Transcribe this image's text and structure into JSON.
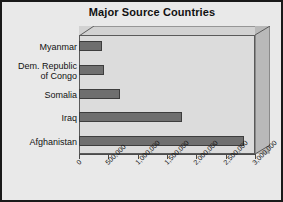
{
  "chart_data": {
    "type": "bar",
    "orientation": "horizontal",
    "title": "Major Source Countries",
    "xlabel": "",
    "ylabel": "",
    "categories": [
      "Myanmar",
      "Dem. Republic of Congo",
      "Somalia",
      "Iraq",
      "Afghanistan"
    ],
    "values": [
      390000,
      420000,
      700000,
      1750000,
      2820000
    ],
    "xlim": [
      0,
      3000000
    ],
    "xticks": [
      0,
      500000,
      1000000,
      1500000,
      2000000,
      2500000,
      3000000
    ],
    "xtick_labels": [
      "0",
      "500,000",
      "1,000,000",
      "1,500,000",
      "2,000,000",
      "2,500,000",
      "3,000,000"
    ],
    "grid": false,
    "legend": null,
    "style": "3d-bar",
    "colors": {
      "bar_fill": "#6f6f6f",
      "bar_edge": "#3d3d3d",
      "plot_back": "#dcdcdc",
      "plot_top": "#d2d2d2",
      "plot_side": "#b9b9b9",
      "figure_background": "#e9e9e9",
      "figure_border": "#1a1a1a",
      "text": "#111111"
    }
  },
  "category_label_lines": [
    [
      "Myanmar"
    ],
    [
      "Dem. Republic",
      "of Congo"
    ],
    [
      "Somalia"
    ],
    [
      "Iraq"
    ],
    [
      "Afghanistan"
    ]
  ]
}
